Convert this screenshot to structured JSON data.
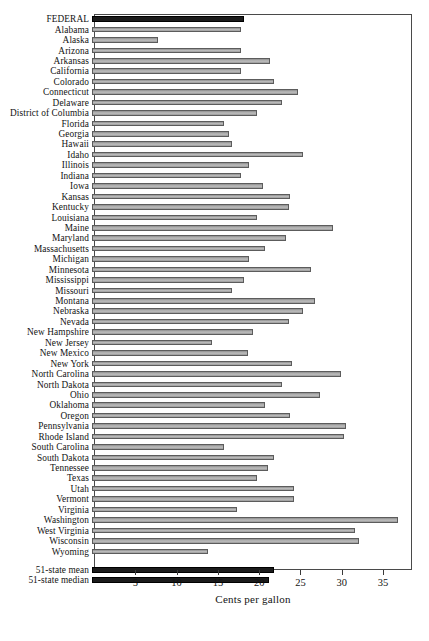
{
  "chart_data": {
    "type": "bar",
    "orientation": "horizontal",
    "title": "",
    "xlabel": "Cents per gallon",
    "ylabel": "",
    "xlim": [
      0,
      38.5
    ],
    "xticks": [
      5,
      10,
      15,
      20,
      25,
      30,
      35
    ],
    "grid": false,
    "legend": null,
    "series_colors": {
      "state_bar": "#b0b0b0",
      "highlight_bar": "#1b1b1b",
      "border": "#5c5c5c"
    },
    "categories": [
      "FEDERAL",
      "Alabama",
      "Alaska",
      "Arizona",
      "Arkansas",
      "California",
      "Colorado",
      "Connecticut",
      "Delaware",
      "District of Columbia",
      "Florida",
      "Georgia",
      "Hawaii",
      "Idaho",
      "Illinois",
      "Indiana",
      "Iowa",
      "Kansas",
      "Kentucky",
      "Louisiana",
      "Maine",
      "Maryland",
      "Massachusetts",
      "Michigan",
      "Minnesota",
      "Mississippi",
      "Missouri",
      "Montana",
      "Nebraska",
      "Nevada",
      "New Hampshire",
      "New Jersey",
      "New Mexico",
      "New York",
      "North Carolina",
      "North Dakota",
      "Ohio",
      "Oklahoma",
      "Oregon",
      "Pennsylvania",
      "Rhode Island",
      "South Carolina",
      "South Dakota",
      "Tennessee",
      "Texas",
      "Utah",
      "Vermont",
      "Virginia",
      "Washington",
      "West Virginia",
      "Wisconsin",
      "Wyoming",
      "51-state mean",
      "51-state median"
    ],
    "values": [
      18.4,
      18.0,
      8.0,
      18.0,
      21.5,
      18.0,
      22.0,
      25.0,
      23.0,
      20.0,
      16.0,
      16.6,
      17.0,
      25.5,
      19.0,
      18.0,
      20.7,
      24.0,
      23.9,
      20.0,
      29.2,
      23.5,
      21.0,
      19.0,
      26.5,
      18.4,
      17.0,
      27.0,
      25.6,
      23.8,
      19.5,
      14.5,
      18.9,
      24.2,
      30.2,
      23.0,
      27.6,
      21.0,
      24.0,
      30.8,
      30.5,
      16.0,
      22.0,
      21.3,
      20.0,
      24.5,
      24.4,
      17.5,
      37.0,
      31.9,
      32.3,
      14.0,
      22.0,
      21.4
    ],
    "highlight_categories": [
      "FEDERAL",
      "51-state mean",
      "51-state median"
    ]
  }
}
